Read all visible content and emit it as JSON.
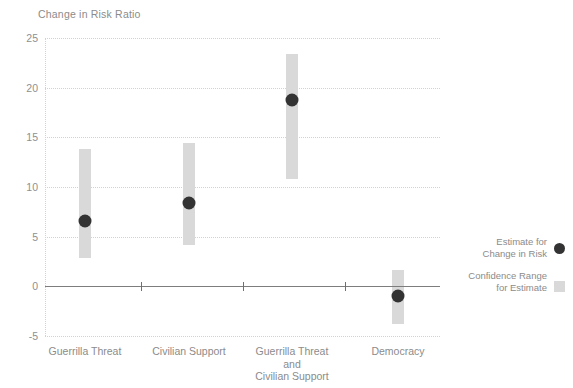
{
  "chart_data": {
    "type": "bar",
    "title": "Change in Risk Ratio",
    "xlabel": "",
    "ylabel": "Change in Risk Ratio",
    "ylim": [
      -5,
      25
    ],
    "yticks": [
      25,
      20,
      15,
      10,
      5,
      0,
      -5
    ],
    "grid": true,
    "legend_position": "right",
    "categories": [
      "Guerrilla Threat",
      "Civilian Support",
      "Guerrilla Threat\nand\nCivilian Support",
      "Democracy"
    ],
    "series": [
      {
        "name": "Estimate for Change in Risk",
        "values": [
          6.6,
          8.4,
          18.8,
          -1.0
        ]
      },
      {
        "name": "Confidence Range for Estimate",
        "lower": [
          2.9,
          4.2,
          10.8,
          -3.8
        ],
        "upper": [
          13.8,
          14.4,
          23.4,
          1.6
        ]
      }
    ],
    "annotations": []
  },
  "legend": {
    "items": [
      {
        "label": "Estimate for\nChange in Risk",
        "marker": "circle",
        "color": "#333333"
      },
      {
        "label": "Confidence Range\nfor Estimate",
        "marker": "square",
        "color": "#d9d9d9"
      }
    ]
  },
  "colors": {
    "estimate_marker": "#333333",
    "confidence_bar": "#d9d9d9",
    "gridline": "#d2d2d2",
    "axis_line": "#7d7d7d",
    "text": "#8b8b8b",
    "background": "#ffffff"
  },
  "ticks": {
    "t0": "25",
    "t1": "20",
    "t2": "15",
    "t3": "10",
    "t4": "5",
    "t5": "0",
    "t6": "-5"
  }
}
